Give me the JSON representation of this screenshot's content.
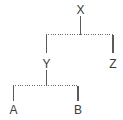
{
  "diagram": {
    "type": "tree",
    "title": "",
    "background_color": "#ffffff",
    "line_color": "#5a5a5a",
    "dotted_line_color": "#6b6b6b",
    "label_color": "#3a3a3a",
    "nodes": [
      {
        "id": "X",
        "label": "X",
        "x": 80,
        "y": 13,
        "role": "root"
      },
      {
        "id": "Y",
        "label": "Y",
        "x": 46,
        "y": 64,
        "role": "internal"
      },
      {
        "id": "Z",
        "label": "Z",
        "x": 113,
        "y": 64,
        "role": "leaf"
      },
      {
        "id": "A",
        "label": "A",
        "x": 13,
        "y": 112,
        "role": "leaf"
      },
      {
        "id": "B",
        "label": "B",
        "x": 78,
        "y": 112,
        "role": "leaf"
      }
    ],
    "edges": [
      {
        "from": "X",
        "to": "join-xyz",
        "style": "solid",
        "orientation": "vertical"
      },
      {
        "from": "join-xyz",
        "to": "Y",
        "style": "solid",
        "orientation": "vertical"
      },
      {
        "from": "join-xyz",
        "to": "Z",
        "style": "solid",
        "orientation": "vertical"
      },
      {
        "from": "Y",
        "to": "join-ab",
        "style": "solid",
        "orientation": "vertical"
      },
      {
        "from": "join-ab",
        "to": "A",
        "style": "solid",
        "orientation": "vertical"
      },
      {
        "from": "join-ab",
        "to": "B",
        "style": "solid",
        "orientation": "vertical"
      }
    ],
    "connectors": [
      {
        "id": "join-xyz",
        "style": "dotted",
        "orientation": "horizontal",
        "y": 34,
        "x1": 46,
        "x2": 113
      },
      {
        "id": "join-ab",
        "style": "dotted",
        "orientation": "horizontal",
        "y": 85,
        "x1": 13,
        "x2": 78
      }
    ]
  },
  "labels": {
    "root": "X",
    "internal": "Y",
    "leaf_right": "Z",
    "leaf_a": "A",
    "leaf_b": "B"
  }
}
